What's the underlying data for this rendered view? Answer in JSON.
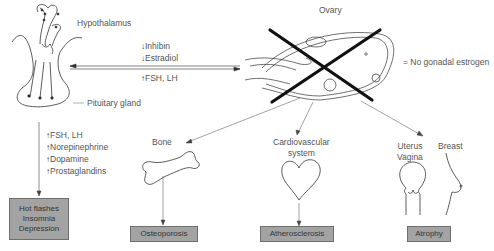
{
  "labels": {
    "hypothalamus": "Hypothalamus",
    "pituitary": "Pituitary gland",
    "ovary": "Ovary",
    "no_estrogen": "= No gonadal estrogen",
    "bone": "Bone",
    "cardio_line1": "Cardiovascular",
    "cardio_line2": "system",
    "uterus": "Uterus",
    "vagina": "Vagina",
    "breast": "Breast"
  },
  "feedback": {
    "down": [
      "Inhibin",
      "Estradiol"
    ],
    "up": [
      "FSH, LH"
    ]
  },
  "pituitary_outputs": [
    "FSH, LH",
    "Norepinephrine",
    "Dopamine",
    "Prostaglandins"
  ],
  "outcomes": {
    "symptoms": [
      "Hot flashes",
      "Insomnia",
      "Depression"
    ],
    "bone": "Osteoporosis",
    "cardio": "Atherosclerosis",
    "reproductive": "Atrophy"
  },
  "colors": {
    "box_fill": "#a3a3a3",
    "box_border": "#6f6f6f",
    "line": "#333333",
    "cross": "#111111"
  }
}
